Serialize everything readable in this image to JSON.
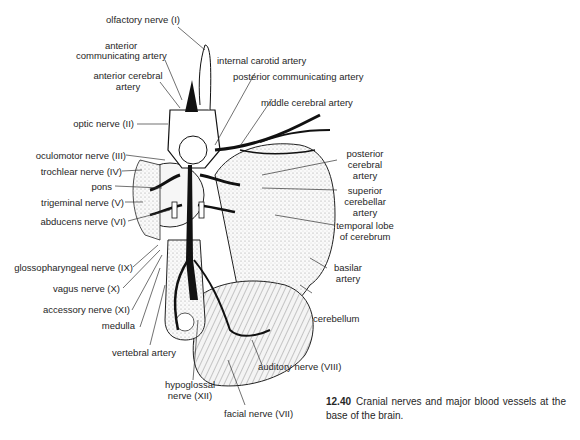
{
  "figure": {
    "number": "12.40",
    "caption": "Cranial nerves and major blood vessels at the base of the brain."
  },
  "labels": {
    "olfactory": "olfactory nerve (I)",
    "ant_comm_1": "anterior",
    "ant_comm_2": "communicating artery",
    "int_carotid": "internal carotid artery",
    "ant_cereb_1": "anterior cerebral",
    "ant_cereb_2": "artery",
    "post_comm": "posterior communicating artery",
    "middle_cereb": "middle cerebral artery",
    "optic": "optic nerve (II)",
    "oculomotor": "oculomotor nerve (III)",
    "trochlear": "trochlear nerve (IV)",
    "pons": "pons",
    "trigeminal": "trigeminal nerve (V)",
    "abducens": "abducens nerve (VI)",
    "post_cereb_1": "posterior",
    "post_cereb_2": "cerebral",
    "post_cereb_3": "artery",
    "sup_cerebellar_1": "superior",
    "sup_cerebellar_2": "cerebellar",
    "sup_cerebellar_3": "artery",
    "temporal_1": "temporal lobe",
    "temporal_2": "of cerebrum",
    "basilar_1": "basilar",
    "basilar_2": "artery",
    "glosso": "glossopharyngeal nerve (IX)",
    "vagus": "vagus nerve (X)",
    "accessory": "accessory nerve (XI)",
    "medulla": "medulla",
    "cerebellum": "cerebellum",
    "vertebral": "vertebral artery",
    "auditory": "auditory nerve (VIII)",
    "hypoglossal_1": "hypoglossal",
    "hypoglossal_2": "nerve (XII)",
    "facial": "facial nerve (VII)"
  }
}
